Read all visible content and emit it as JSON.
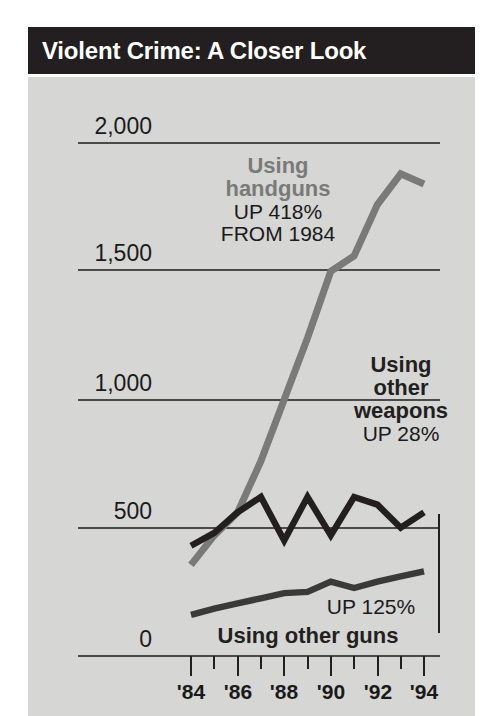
{
  "title": {
    "text": "Violent Crime: A Closer Look"
  },
  "colors": {
    "banner_bg": "#231f20",
    "panel_bg": "#d6d6d4",
    "handgun_line": "#7a7a78",
    "other_weapons_line": "#231f20",
    "other_guns_line": "#3a3a38",
    "gridline": "#4a4a48",
    "axis": "#4a4a48",
    "text": "#1a1a1a",
    "title_text": "#ffffff"
  },
  "annotations": {
    "handguns": {
      "line1": "Using",
      "line2": "handguns",
      "line3": "UP 418%",
      "line4": "FROM 1984"
    },
    "other_weapons": {
      "line1": "Using",
      "line2": "other",
      "line3": "weapons",
      "line4": "UP 28%"
    },
    "other_guns": {
      "line1": "UP 125%",
      "line2": "Using other guns"
    }
  },
  "chart_data": {
    "type": "line",
    "title": "Violent Crime: A Closer Look",
    "xlabel": "",
    "ylabel": "",
    "xlim": [
      1983.5,
      1994.5
    ],
    "ylim": [
      0,
      2000
    ],
    "grid": true,
    "gridlines": [
      500,
      1000,
      1500,
      2000
    ],
    "legend_position": "inline-annotations",
    "ytick_labels": [
      "0",
      "500",
      "1,000",
      "1,500",
      "2,000"
    ],
    "ytick_values": [
      0,
      500,
      1000,
      1500,
      2000
    ],
    "xtick_labels": [
      "'84",
      "'86",
      "'88",
      "'90",
      "'92",
      "'94"
    ],
    "xtick_values": [
      1984,
      1986,
      1988,
      1990,
      1992,
      1994
    ],
    "minor_xtick_values": [
      1985,
      1987,
      1989,
      1991,
      1993
    ],
    "x": [
      1984,
      1985,
      1986,
      1987,
      1988,
      1989,
      1990,
      1991,
      1992,
      1993,
      1994
    ],
    "series": [
      {
        "name": "Using handguns",
        "color": "#7a7a78",
        "annotation": "UP 418% FROM 1984",
        "values": [
          355,
          470,
          560,
          760,
          1000,
          1240,
          1500,
          1560,
          1760,
          1880,
          1840
        ]
      },
      {
        "name": "Using other weapons",
        "color": "#231f20",
        "annotation": "UP 28%",
        "values": [
          430,
          480,
          560,
          620,
          450,
          620,
          470,
          620,
          590,
          500,
          560
        ]
      },
      {
        "name": "Using other guns",
        "color": "#3a3a38",
        "annotation": "UP 125%",
        "values": [
          160,
          185,
          205,
          225,
          245,
          250,
          290,
          265,
          290,
          310,
          330
        ]
      }
    ]
  }
}
